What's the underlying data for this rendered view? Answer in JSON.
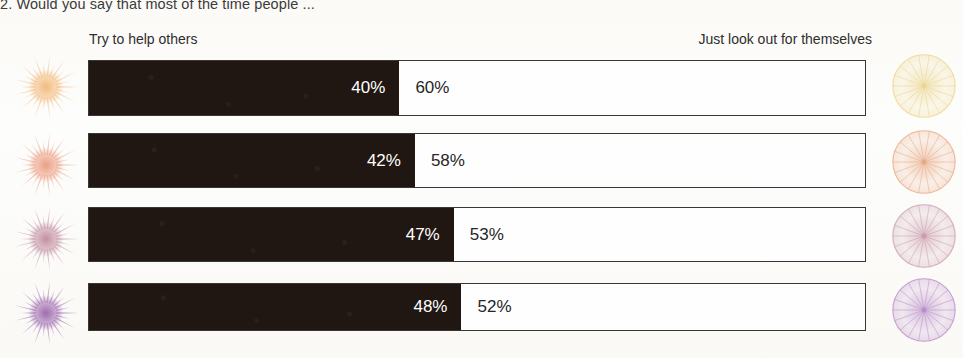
{
  "question": {
    "text": "2. Would you say that most of the time people ..."
  },
  "axis": {
    "left_label": "Try to help others",
    "right_label": "Just look out for themselves"
  },
  "colors": {
    "bar_dark": "#211712",
    "bar_light": "#fefefe",
    "border": "#3a3632",
    "page": "#fdfcfa",
    "row_1_accent": "#f3b878",
    "row_2_accent": "#eb9a7d",
    "row_3_accent": "#c08a9e",
    "row_4_accent": "#9a64ab"
  },
  "chart_data": {
    "type": "bar",
    "title": "2. Would you say that most of the time people ...",
    "subtype": "stacked-100-horizontal",
    "xlabel": "",
    "ylabel": "",
    "xlim": [
      0,
      100
    ],
    "grid": false,
    "legend_position": "top",
    "categories": [
      "Row 1",
      "Row 2",
      "Row 3",
      "Row 4"
    ],
    "series": [
      {
        "name": "Try to help others",
        "values": [
          40,
          42,
          47,
          48
        ]
      },
      {
        "name": "Just look out for themselves",
        "values": [
          60,
          58,
          53,
          52
        ]
      }
    ],
    "rows": [
      {
        "left_value": 40,
        "left_label": "40%",
        "right_value": 60,
        "right_label": "60%",
        "left_icon": "starburst-orange-icon",
        "right_icon": "spoked-wheel-yellow-icon",
        "left_icon_color": "#f3b878",
        "right_icon_color": "#efd98e"
      },
      {
        "left_value": 42,
        "left_label": "42%",
        "right_value": 58,
        "right_label": "58%",
        "left_icon": "starburst-salmon-icon",
        "right_icon": "spoked-wheel-orange-icon",
        "left_icon_color": "#eb9a7d",
        "right_icon_color": "#e8a municipal"
      },
      {
        "left_value": 47,
        "left_label": "47%",
        "right_value": 53,
        "right_label": "53%",
        "left_icon": "starburst-pink-icon",
        "right_icon": "spoked-wheel-pink-icon",
        "left_icon_color": "#c08a9e",
        "right_icon_color": "#c99bab"
      },
      {
        "left_value": 48,
        "left_label": "48%",
        "right_value": 52,
        "right_label": "52%",
        "left_icon": "starburst-purple-icon",
        "right_icon": "spoked-wheel-purple-icon",
        "left_icon_color": "#9a64ab",
        "right_icon_color": "#b98bc9"
      }
    ]
  }
}
